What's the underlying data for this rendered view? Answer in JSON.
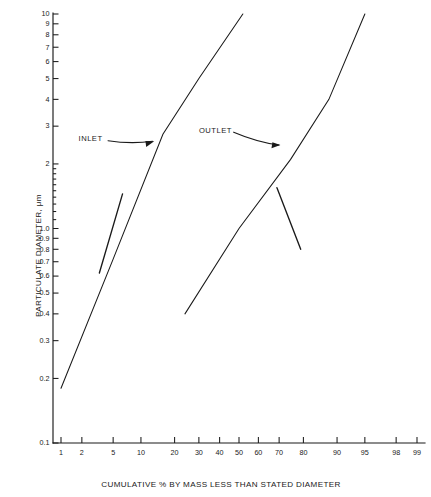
{
  "chart_data": {
    "type": "line",
    "title": "",
    "xlabel": "CUMULATIVE % BY MASS LESS THAN STATED DIAMETER",
    "ylabel": "PARTICULATE DIAMETER, μm",
    "x_scale": "probability",
    "y_scale": "log",
    "xlim": [
      0.6,
      99.6
    ],
    "ylim": [
      0.1,
      10
    ],
    "grid": false,
    "legend": "inline-annotations",
    "x_ticks": [
      1,
      2,
      5,
      10,
      20,
      30,
      40,
      50,
      60,
      70,
      80,
      90,
      95,
      98,
      99
    ],
    "x_tick_labels": [
      "1",
      "2",
      "5",
      "10",
      "20",
      "30",
      "40",
      "50",
      "60",
      "70",
      "80",
      "90",
      "95",
      "98",
      "99"
    ],
    "y_ticks": [
      0.1,
      0.2,
      0.3,
      0.4,
      0.5,
      0.6,
      0.7,
      0.8,
      0.9,
      1.0,
      2,
      3,
      4,
      5,
      6,
      7,
      8,
      9,
      10
    ],
    "y_tick_labels": [
      "0.1",
      "0.2",
      "0.3",
      "0.4",
      "0.5",
      "0.6",
      "0.7",
      "0.8",
      "0.9",
      "1.0",
      "2",
      "3",
      "4",
      "5",
      "6",
      "7",
      "8",
      "9",
      "10"
    ],
    "y_minor_ticks": [
      1.1,
      1.2,
      1.3,
      1.4,
      1.5,
      1.6,
      1.7,
      1.8,
      1.9
    ],
    "series": [
      {
        "name": "INLET",
        "label": "INLET",
        "points": [
          {
            "x": 1.0,
            "y": 0.18
          },
          {
            "x": 5.0,
            "y": 0.72
          },
          {
            "x": 16.0,
            "y": 2.75
          },
          {
            "x": 30.0,
            "y": 5.0
          },
          {
            "x": 52.0,
            "y": 10.0
          }
        ],
        "cross_segment": [
          {
            "x": 3.4,
            "y": 0.62
          },
          {
            "x": 6.4,
            "y": 1.45
          }
        ]
      },
      {
        "name": "OUTLET",
        "label": "OUTLET",
        "points": [
          {
            "x": 24.0,
            "y": 0.4
          },
          {
            "x": 50.0,
            "y": 1.0
          },
          {
            "x": 75.0,
            "y": 2.1
          },
          {
            "x": 88.0,
            "y": 4.0
          },
          {
            "x": 95.0,
            "y": 10.0
          }
        ],
        "cross_segment": [
          {
            "x": 69.0,
            "y": 1.55
          },
          {
            "x": 79.0,
            "y": 0.8
          }
        ]
      }
    ],
    "annotations": [
      {
        "name": "INLET",
        "text": "INLET",
        "text_x": 1.8,
        "text_y": 2.6,
        "target_x": 15.0,
        "target_y": 2.55
      },
      {
        "name": "OUTLET",
        "text": "OUTLET",
        "text_x": 30.0,
        "text_y": 2.85,
        "target_x": 73.0,
        "target_y": 2.45
      }
    ],
    "colors": {
      "background": "#ffffff",
      "ink": "#1a1a1a",
      "line": "#1a1a1a"
    }
  }
}
